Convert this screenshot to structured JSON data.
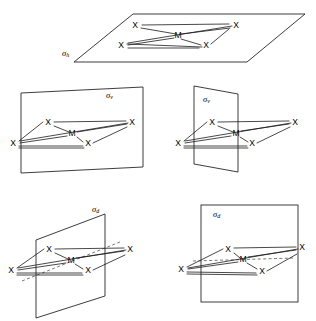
{
  "figure": {
    "canvas": {
      "width": 316,
      "height": 321,
      "background": "#ffffff"
    },
    "colors": {
      "stroke": "#1a1a1a",
      "dashed": "#555555",
      "text": "#000000",
      "background": "#ffffff"
    },
    "atom_labels": {
      "ligand": "X",
      "metal": "M"
    },
    "plane_symbols": {
      "horizontal": "σ",
      "horizontal_sub": "h",
      "vertical": "σ",
      "vertical_sub": "v",
      "dihedral": "σ",
      "dihedral_sub": "d"
    },
    "panels": [
      {
        "id": "panel-sigma-h",
        "name": "sigma-h-horizontal-plane",
        "label": "σ",
        "label_sub": "h",
        "label_full": "σh",
        "label_x": 62,
        "label_y": 54,
        "plane_type": "horizontal-parallelogram",
        "plane_points": "74,44 132,14 305,14 247,62 74,62 74,44",
        "plane_path": "M 133,14 L 305,14 L 247,62 L 74,62 Z",
        "atoms": [
          {
            "label": "X",
            "x": 135,
            "y": 26,
            "position": "top-left-ligand"
          },
          {
            "label": "X",
            "x": 236,
            "y": 26,
            "position": "top-right-ligand"
          },
          {
            "label": "X",
            "x": 121,
            "y": 46,
            "position": "bottom-left-ligand"
          },
          {
            "label": "X",
            "x": 206,
            "y": 46,
            "position": "bottom-right-ligand"
          }
        ],
        "metal": {
          "label": "M",
          "x": 178,
          "y": 36
        },
        "dashed": []
      },
      {
        "id": "panel-sigma-v-left",
        "name": "sigma-v-vertical-plane-in-plane-view",
        "label": "σ",
        "label_sub": "v",
        "label_full": "σv",
        "label_x": 106,
        "label_y": 96,
        "plane_type": "vertical-parallelogram",
        "plane_path": "M 21,93 L 143,87 L 143,167 L 21,173 Z",
        "atoms": [
          {
            "label": "X",
            "x": 48,
            "y": 123,
            "position": "top-left-ligand"
          },
          {
            "label": "X",
            "x": 132,
            "y": 123,
            "position": "right-ligand"
          },
          {
            "label": "X",
            "x": 13,
            "y": 144,
            "position": "left-ligand"
          },
          {
            "label": "X",
            "x": 88,
            "y": 144,
            "position": "bottom-ligand"
          }
        ],
        "metal": {
          "label": "M",
          "x": 72,
          "y": 134
        },
        "dashed": []
      },
      {
        "id": "panel-sigma-v-right",
        "name": "sigma-v-vertical-plane-edge-on-view",
        "label": "σ",
        "label_sub": "v",
        "label_full": "σv",
        "label_x": 203,
        "label_y": 100,
        "plane_type": "vertical-parallelogram-edge-on",
        "plane_path": "M 194,86 L 238,94 L 238,172 L 194,164 Z",
        "atoms": [
          {
            "label": "X",
            "x": 212,
            "y": 123,
            "position": "top-left-ligand"
          },
          {
            "label": "X",
            "x": 295,
            "y": 123,
            "position": "right-ligand"
          },
          {
            "label": "X",
            "x": 178,
            "y": 144,
            "position": "left-ligand"
          },
          {
            "label": "X",
            "x": 252,
            "y": 144,
            "position": "bottom-ligand"
          }
        ],
        "metal": {
          "label": "M",
          "x": 236,
          "y": 134
        },
        "dashed": []
      },
      {
        "id": "panel-sigma-d-left",
        "name": "sigma-d-dihedral-plane-edge-on-view",
        "label": "σ",
        "label_sub": "d",
        "label_full": "σd",
        "label_x": 92,
        "label_y": 210,
        "plane_type": "dihedral-parallelogram",
        "plane_path": "M 36,240 L 105,214 L 105,296 L 36,318 Z",
        "atoms": [
          {
            "label": "X",
            "x": 49,
            "y": 250,
            "position": "top-left-ligand"
          },
          {
            "label": "X",
            "x": 130,
            "y": 250,
            "position": "right-ligand"
          },
          {
            "label": "X",
            "x": 11,
            "y": 271,
            "position": "left-ligand"
          },
          {
            "label": "X",
            "x": 88,
            "y": 271,
            "position": "bottom-ligand"
          }
        ],
        "metal": {
          "label": "M",
          "x": 71,
          "y": 261
        },
        "dashed": [
          {
            "x1": 22,
            "y1": 281,
            "x2": 120,
            "y2": 242
          }
        ]
      },
      {
        "id": "panel-sigma-d-right",
        "name": "sigma-d-dihedral-plane-square-view",
        "label": "σ",
        "label_sub": "d",
        "label_full": "σd",
        "label_x": 213,
        "label_y": 215,
        "plane_type": "rectangle",
        "plane_rect": {
          "x": 201,
          "y": 205,
          "width": 97,
          "height": 97
        },
        "atoms": [
          {
            "label": "X",
            "x": 228,
            "y": 250,
            "position": "top-left-ligand"
          },
          {
            "label": "X",
            "x": 302,
            "y": 248,
            "position": "right-ligand"
          },
          {
            "label": "X",
            "x": 181,
            "y": 270,
            "position": "left-ligand"
          },
          {
            "label": "X",
            "x": 262,
            "y": 272,
            "position": "bottom-ligand"
          }
        ],
        "metal": {
          "label": "M",
          "x": 243,
          "y": 260
        },
        "dashed": [
          {
            "x1": 193,
            "y1": 261,
            "x2": 294,
            "y2": 258
          }
        ]
      }
    ]
  }
}
